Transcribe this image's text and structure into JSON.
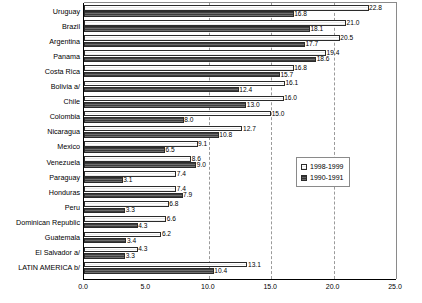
{
  "chart_data": {
    "type": "bar",
    "orientation": "horizontal",
    "title": "",
    "subtitle": "",
    "xlabel": "",
    "ylabel": "",
    "xlim": [
      0.0,
      25.0
    ],
    "xticks": [
      "0.0",
      "5.0",
      "10.0",
      "15.0",
      "20.0",
      "25.0"
    ],
    "xtick_values": [
      0.0,
      5.0,
      10.0,
      15.0,
      20.0,
      25.0
    ],
    "grid": "vertical-dashed-at-10-15-20",
    "legend_position": "middle-right-inside",
    "categories": [
      "Uruguay",
      "Brazil",
      "Argentina",
      "Panama",
      "Costa Rica",
      "Bolivia a/",
      "Chile",
      "Colombia",
      "Nicaragua",
      "Mexico",
      "Venezuela",
      "Paraguay",
      "Honduras",
      "Peru",
      "Dominican Republic",
      "Guatemala",
      "El Salvador a/",
      "LATIN AMERICA b/"
    ],
    "series": [
      {
        "name": "1998-1999",
        "color": "#f2f2f2",
        "values": [
          22.8,
          21.0,
          20.5,
          19.4,
          16.8,
          16.1,
          16.0,
          15.0,
          12.7,
          9.1,
          8.6,
          7.4,
          7.4,
          6.8,
          6.6,
          6.2,
          4.3,
          13.1
        ],
        "labels": [
          "22.8",
          "21.0",
          "20.5",
          "19.4",
          "16.8",
          "16.1",
          "16.0",
          "15.0",
          "12.7",
          "9.1",
          "8.6",
          "7.4",
          "7.4",
          "6.8",
          "6.6",
          "6.2",
          "4.3",
          "13.1"
        ]
      },
      {
        "name": "1990-1991",
        "color": "#5a5a5a",
        "values": [
          16.8,
          18.1,
          17.7,
          18.6,
          15.7,
          12.4,
          13.0,
          8.0,
          10.8,
          6.5,
          9.0,
          3.1,
          7.9,
          3.3,
          4.3,
          3.4,
          3.3,
          10.4
        ],
        "labels": [
          "16.8",
          "18.1",
          "17.7",
          "18.6",
          "15.7",
          "12.4",
          "13.0",
          "8.0",
          "10.8",
          "6.5",
          "9.0",
          "3.1",
          "7.9",
          "3.3",
          "4.3",
          "3.4",
          "3.3",
          "10.4"
        ]
      }
    ]
  }
}
